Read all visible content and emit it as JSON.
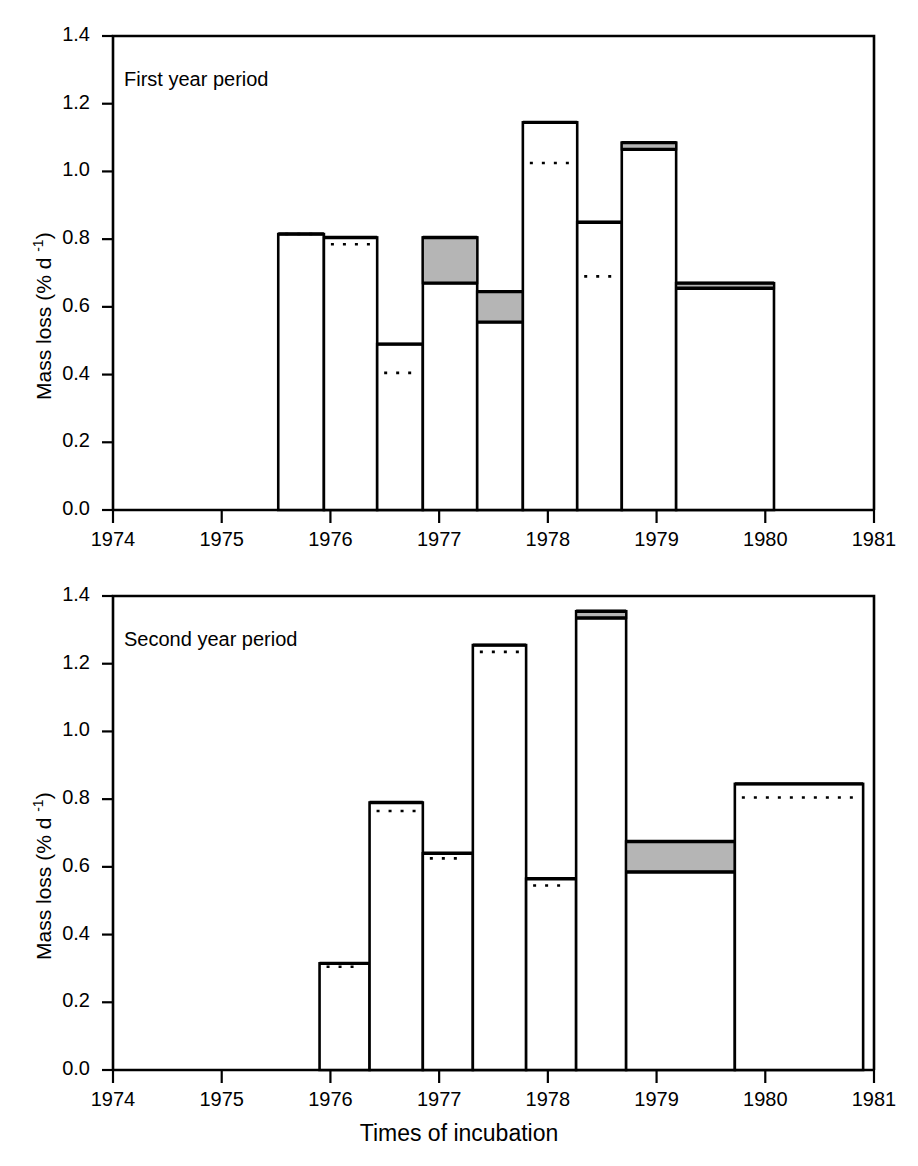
{
  "figure": {
    "xaxis_title": "Times of incubation",
    "yaxis_title_main": "Mass loss (% d ",
    "yaxis_title_sup": "-1",
    "yaxis_title_close": ")"
  },
  "panels": [
    {
      "id": "first-year",
      "tag": "First year period",
      "ylabel": "Mass loss (% d -1)",
      "yticks": [
        "1.4",
        "1.2",
        "1.0",
        "0.8",
        "0.6",
        "0.4",
        "0.2",
        "0.0"
      ],
      "xticks": [
        "1974",
        "1975",
        "1976",
        "1977",
        "1978",
        "1979",
        "1980",
        "1981"
      ]
    },
    {
      "id": "second-year",
      "tag": "Second year period",
      "ylabel": "Mass loss (% d -1)",
      "yticks": [
        "1.4",
        "1.2",
        "1.0",
        "0.8",
        "0.6",
        "0.4",
        "0.2",
        "0.0"
      ],
      "xticks": [
        "1974",
        "1975",
        "1976",
        "1977",
        "1978",
        "1979",
        "1980",
        "1981"
      ]
    }
  ],
  "chart_data": [
    {
      "type": "bar",
      "title": "First year period",
      "xlabel": "Times of incubation",
      "ylabel": "Mass loss (% d -1)",
      "ylim": [
        0.0,
        1.4
      ],
      "xlim": [
        1974,
        1981
      ],
      "yticks": [
        0.0,
        0.2,
        0.4,
        0.6,
        0.8,
        1.0,
        1.2,
        1.4
      ],
      "xticks": [
        1974,
        1975,
        1976,
        1977,
        1978,
        1979,
        1980,
        1981
      ],
      "grid": false,
      "legend": "none",
      "bars": [
        {
          "x_start": 1975.52,
          "x_end": 1975.94,
          "value": 0.815,
          "shade_bottom": null,
          "dotted_level": 0.815
        },
        {
          "x_start": 1975.94,
          "x_end": 1976.43,
          "value": 0.805,
          "shade_bottom": null,
          "dotted_level": 0.785
        },
        {
          "x_start": 1976.43,
          "x_end": 1976.85,
          "value": 0.49,
          "shade_bottom": null,
          "dotted_level": 0.405
        },
        {
          "x_start": 1976.85,
          "x_end": 1977.35,
          "value": 0.805,
          "shade_bottom": 0.67,
          "dotted_level": null
        },
        {
          "x_start": 1977.35,
          "x_end": 1977.77,
          "value": 0.645,
          "shade_bottom": 0.555,
          "dotted_level": null
        },
        {
          "x_start": 1977.77,
          "x_end": 1978.27,
          "value": 1.145,
          "shade_bottom": null,
          "dotted_level": 1.025
        },
        {
          "x_start": 1978.27,
          "x_end": 1978.68,
          "value": 0.85,
          "shade_bottom": null,
          "dotted_level": 0.69
        },
        {
          "x_start": 1978.68,
          "x_end": 1979.18,
          "value": 1.085,
          "shade_bottom": 1.065,
          "dotted_level": null
        },
        {
          "x_start": 1979.18,
          "x_end": 1980.08,
          "value": 0.67,
          "shade_bottom": 0.655,
          "dotted_level": null
        }
      ]
    },
    {
      "type": "bar",
      "title": "Second year period",
      "xlabel": "Times of incubation",
      "ylabel": "Mass loss (% d -1)",
      "ylim": [
        0.0,
        1.4
      ],
      "xlim": [
        1974,
        1981
      ],
      "yticks": [
        0.0,
        0.2,
        0.4,
        0.6,
        0.8,
        1.0,
        1.2,
        1.4
      ],
      "xticks": [
        1974,
        1975,
        1976,
        1977,
        1978,
        1979,
        1980,
        1981
      ],
      "grid": false,
      "legend": "none",
      "bars": [
        {
          "x_start": 1975.9,
          "x_end": 1976.36,
          "value": 0.315,
          "shade_bottom": null,
          "dotted_level": 0.305
        },
        {
          "x_start": 1976.36,
          "x_end": 1976.85,
          "value": 0.79,
          "shade_bottom": null,
          "dotted_level": 0.765
        },
        {
          "x_start": 1976.85,
          "x_end": 1977.31,
          "value": 0.64,
          "shade_bottom": null,
          "dotted_level": 0.625
        },
        {
          "x_start": 1977.31,
          "x_end": 1977.8,
          "value": 1.255,
          "shade_bottom": null,
          "dotted_level": 1.235
        },
        {
          "x_start": 1977.8,
          "x_end": 1978.26,
          "value": 0.565,
          "shade_bottom": null,
          "dotted_level": 0.545
        },
        {
          "x_start": 1978.26,
          "x_end": 1978.72,
          "value": 1.355,
          "shade_bottom": 1.335,
          "dotted_level": null
        },
        {
          "x_start": 1978.72,
          "x_end": 1979.72,
          "value": 0.675,
          "shade_bottom": 0.585,
          "dotted_level": null
        },
        {
          "x_start": 1979.72,
          "x_end": 1980.9,
          "value": 0.845,
          "shade_bottom": null,
          "dotted_level": 0.805
        }
      ]
    }
  ],
  "colors": {
    "line": "#000000",
    "shade_fill": "#b5b5b5",
    "background": "#ffffff"
  }
}
